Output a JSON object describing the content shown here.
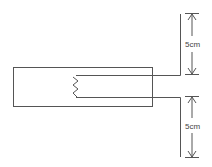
{
  "diagram": {
    "dimensions": [
      {
        "label": "5cm",
        "position": "upper"
      },
      {
        "label": "5cm",
        "position": "lower"
      }
    ],
    "colors": {
      "line": "#555555",
      "background": "#ffffff"
    }
  }
}
